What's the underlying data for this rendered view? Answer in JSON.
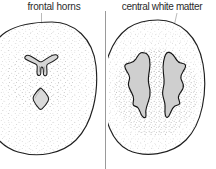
{
  "figure": {
    "background_color": "#ffffff",
    "ink_color": "#1a1a1a",
    "stipple_color": "#8a8a8a",
    "ventricle_fill": "#d8d8d8",
    "leader_line_color": "#a8a8a8",
    "divider_color": "#9a9a9a",
    "width": 216,
    "height": 169
  },
  "panels": [
    {
      "id": "frontal-horns",
      "label": "frontal horns",
      "side": "left",
      "structures": [
        {
          "name": "brain-outline",
          "shape": "oval-cross-section"
        },
        {
          "name": "frontal-horns-ventricle",
          "shape": "y-shaped",
          "filled": true
        },
        {
          "name": "third-ventricle",
          "shape": "diamond",
          "filled": true
        }
      ],
      "leader_line": {
        "orientation": "vertical",
        "from_label": true
      }
    },
    {
      "id": "central-white-matter",
      "label": "central white matter",
      "side": "right",
      "structures": [
        {
          "name": "brain-outline",
          "shape": "oval-cross-section"
        },
        {
          "name": "left-lateral-ventricle",
          "shape": "elongated-jagged",
          "filled": true
        },
        {
          "name": "right-lateral-ventricle",
          "shape": "elongated-jagged",
          "filled": true
        },
        {
          "name": "white-matter-stipple",
          "shape": "dense-stipple-field"
        }
      ],
      "leader_line": {
        "orientation": "slanted",
        "from_label": true
      }
    }
  ],
  "divider": {
    "name": "panel-divider",
    "orientation": "vertical"
  }
}
